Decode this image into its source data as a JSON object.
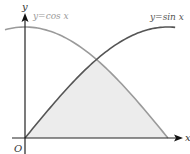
{
  "chart_data": {
    "type": "line",
    "title": "",
    "xlabel": "x",
    "ylabel": "y",
    "origin_label": "O",
    "xlim": [
      -0.22,
      1.68
    ],
    "ylim": [
      -0.14,
      1.1
    ],
    "grid": false,
    "series": [
      {
        "name": "y = cos x",
        "label": "y=cos x",
        "function": "cos",
        "x_range": [
          -0.22,
          1.5708
        ],
        "color": "#9a9a9a"
      },
      {
        "name": "y = sin x",
        "label": "y=sin x",
        "function": "sin",
        "x_range": [
          0,
          1.65
        ],
        "color": "#555555"
      }
    ],
    "shaded_region": {
      "description": "Region bounded by y=sin x, y=cos x and the x-axis from x=0 to x=π/2",
      "x_range": [
        0,
        1.5708
      ],
      "intersection": {
        "x": 0.7854,
        "y": 0.7071
      },
      "fill": "#ececec"
    },
    "annotations": [
      {
        "text": "y=cos x",
        "position": "top-left, beside y-axis"
      },
      {
        "text": "y=sin x",
        "position": "top-right"
      },
      {
        "text": "O",
        "position": "origin"
      },
      {
        "text": "x",
        "position": "x-axis arrow end"
      },
      {
        "text": "y",
        "position": "y-axis arrow top"
      }
    ]
  },
  "labels": {
    "y_axis": "y",
    "x_axis": "x",
    "origin": "O",
    "cos_label": "y=cos x",
    "sin_label": "y=sin x"
  }
}
